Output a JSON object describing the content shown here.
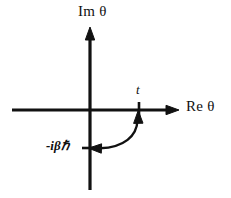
{
  "figure": {
    "name": "complex-time-contour-diagram",
    "background_color": "#ffffff",
    "stroke_color": "#111111"
  },
  "axes": {
    "imaginary": {
      "label": "Im θ",
      "icon": "arrow-up-icon"
    },
    "real": {
      "label": "Re θ",
      "icon": "arrow-right-icon"
    }
  },
  "markers": [
    {
      "name": "point-t",
      "label": "t",
      "axis": "real"
    },
    {
      "name": "point-minus-i-beta-hbar",
      "label": "-iβℏ",
      "axis": "imaginary"
    }
  ],
  "contour": {
    "name": "contour-arrow",
    "arrowheads": [
      "arrow-up-icon",
      "arrow-left-icon"
    ],
    "description": "curved double-headed arrow from t to -iβℏ"
  }
}
